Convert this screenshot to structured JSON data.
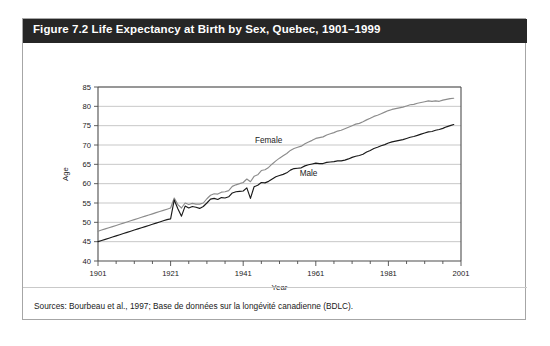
{
  "figure": {
    "title": "Figure 7.2 Life Expectancy at Birth by Sex, Quebec, 1901–1999",
    "source": "Sources: Bourbeau et al., 1997; Base de données sur la longévité canadienne (BDLC)."
  },
  "colors": {
    "title_bar": "#262626",
    "title_text": "#ffffff",
    "frame_border": "#a6a6a6",
    "gridline": "#b0b0b0",
    "axis": "#4d4d4d",
    "female_line": "#8c8c8c",
    "male_line": "#1a1a1a"
  },
  "chart_data": {
    "type": "line",
    "title": "Figure 7.2 Life Expectancy at Birth by Sex, Quebec, 1901–1999",
    "xlabel": "Year",
    "ylabel": "Age",
    "xlim": [
      1901,
      2001
    ],
    "ylim": [
      40,
      85
    ],
    "yticks": [
      40,
      45,
      50,
      55,
      60,
      65,
      70,
      75,
      80,
      85
    ],
    "xticks": [
      1901,
      1921,
      1941,
      1961,
      1981,
      2001
    ],
    "x_minor_tick_interval": 5,
    "grid": "horizontal",
    "legend": "inline-labels",
    "annotations": [
      {
        "text": "Female",
        "x": 1948,
        "y": 70.5
      },
      {
        "text": "Male",
        "x": 1959,
        "y": 62.0
      }
    ],
    "series": [
      {
        "name": "Female",
        "color": "#8c8c8c",
        "label_position": {
          "x": 1948,
          "y": 70.5
        },
        "x": [
          1901,
          1902,
          1903,
          1904,
          1905,
          1906,
          1907,
          1908,
          1909,
          1910,
          1911,
          1912,
          1913,
          1914,
          1915,
          1916,
          1917,
          1918,
          1919,
          1920,
          1921,
          1922,
          1923,
          1924,
          1925,
          1926,
          1927,
          1928,
          1929,
          1930,
          1931,
          1932,
          1933,
          1934,
          1935,
          1936,
          1937,
          1938,
          1939,
          1940,
          1941,
          1942,
          1943,
          1944,
          1945,
          1946,
          1947,
          1948,
          1949,
          1950,
          1951,
          1952,
          1953,
          1954,
          1955,
          1956,
          1957,
          1958,
          1959,
          1960,
          1961,
          1962,
          1963,
          1964,
          1965,
          1966,
          1967,
          1968,
          1969,
          1970,
          1971,
          1972,
          1973,
          1974,
          1975,
          1976,
          1977,
          1978,
          1979,
          1980,
          1981,
          1982,
          1983,
          1984,
          1985,
          1986,
          1987,
          1988,
          1989,
          1990,
          1991,
          1992,
          1993,
          1994,
          1995,
          1996,
          1997,
          1998,
          1999
        ],
        "values": [
          47.7,
          48.0,
          48.3,
          48.6,
          48.9,
          49.2,
          49.5,
          49.8,
          50.1,
          50.4,
          50.7,
          51.0,
          51.3,
          51.6,
          51.9,
          52.2,
          52.5,
          52.8,
          53.1,
          53.4,
          53.7,
          56.3,
          54.6,
          53.7,
          55.0,
          54.6,
          54.9,
          54.7,
          54.7,
          55.0,
          56.1,
          57.0,
          57.4,
          57.3,
          57.8,
          57.9,
          58.2,
          59.3,
          59.7,
          60.0,
          60.3,
          61.2,
          60.5,
          61.9,
          62.3,
          63.4,
          63.6,
          64.2,
          65.1,
          65.9,
          66.6,
          67.2,
          67.8,
          68.6,
          69.1,
          69.4,
          69.7,
          70.3,
          70.8,
          71.2,
          71.7,
          71.9,
          72.1,
          72.6,
          72.9,
          73.2,
          73.6,
          73.8,
          74.2,
          74.6,
          75.0,
          75.4,
          75.6,
          76.0,
          76.5,
          76.9,
          77.4,
          77.7,
          78.1,
          78.5,
          78.9,
          79.2,
          79.4,
          79.6,
          79.8,
          80.1,
          80.4,
          80.5,
          80.8,
          81.0,
          81.2,
          81.4,
          81.3,
          81.4,
          81.3,
          81.6,
          81.8,
          82.0,
          82.1
        ]
      },
      {
        "name": "Male",
        "color": "#1a1a1a",
        "label_position": {
          "x": 1959,
          "y": 62.0
        },
        "x": [
          1901,
          1902,
          1903,
          1904,
          1905,
          1906,
          1907,
          1908,
          1909,
          1910,
          1911,
          1912,
          1913,
          1914,
          1915,
          1916,
          1917,
          1918,
          1919,
          1920,
          1921,
          1922,
          1923,
          1924,
          1925,
          1926,
          1927,
          1928,
          1929,
          1930,
          1931,
          1932,
          1933,
          1934,
          1935,
          1936,
          1937,
          1938,
          1939,
          1940,
          1941,
          1942,
          1943,
          1944,
          1945,
          1946,
          1947,
          1948,
          1949,
          1950,
          1951,
          1952,
          1953,
          1954,
          1955,
          1956,
          1957,
          1958,
          1959,
          1960,
          1961,
          1962,
          1963,
          1964,
          1965,
          1966,
          1967,
          1968,
          1969,
          1970,
          1971,
          1972,
          1973,
          1974,
          1975,
          1976,
          1977,
          1978,
          1979,
          1980,
          1981,
          1982,
          1983,
          1984,
          1985,
          1986,
          1987,
          1988,
          1989,
          1990,
          1991,
          1992,
          1993,
          1994,
          1995,
          1996,
          1997,
          1998,
          1999
        ],
        "values": [
          45.0,
          45.3,
          45.6,
          45.9,
          46.2,
          46.5,
          46.8,
          47.1,
          47.4,
          47.7,
          48.0,
          48.3,
          48.6,
          48.9,
          49.2,
          49.5,
          49.8,
          50.1,
          50.4,
          50.7,
          50.9,
          55.8,
          53.5,
          51.6,
          54.2,
          53.7,
          54.1,
          53.9,
          53.6,
          54.1,
          55.0,
          56.0,
          56.2,
          55.9,
          56.4,
          56.3,
          56.6,
          57.6,
          57.9,
          58.0,
          58.1,
          58.9,
          56.2,
          59.2,
          59.6,
          60.3,
          60.2,
          60.6,
          61.2,
          61.8,
          62.1,
          62.4,
          62.8,
          63.5,
          63.9,
          64.0,
          64.1,
          64.6,
          64.9,
          65.1,
          65.3,
          65.2,
          65.2,
          65.5,
          65.6,
          65.7,
          65.9,
          65.9,
          66.1,
          66.4,
          66.8,
          67.1,
          67.3,
          67.6,
          68.2,
          68.6,
          69.1,
          69.4,
          69.8,
          70.1,
          70.5,
          70.8,
          71.0,
          71.2,
          71.4,
          71.7,
          72.0,
          72.2,
          72.5,
          72.8,
          73.1,
          73.4,
          73.5,
          73.8,
          74.0,
          74.3,
          74.7,
          75.0,
          75.3
        ]
      }
    ]
  }
}
